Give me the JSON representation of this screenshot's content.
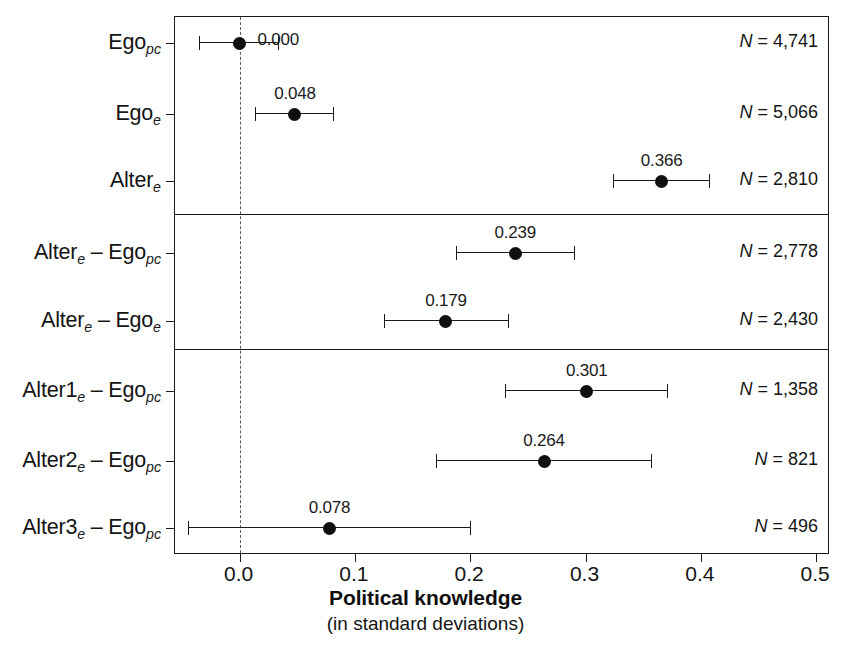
{
  "chart_data": {
    "type": "scatter",
    "subtype": "forest-plot",
    "title": "",
    "xlabel": "Political knowledge",
    "xlabel_sub": "(in standard deviations)",
    "ylabel": "",
    "xlim": [
      -0.056,
      0.512
    ],
    "xticks": [
      0.0,
      0.1,
      0.2,
      0.3,
      0.4,
      0.5
    ],
    "xticklabels": [
      "0.0",
      "0.1",
      "0.2",
      "0.3",
      "0.4",
      "0.5"
    ],
    "grid": false,
    "legend": null,
    "reference_line": 0.0,
    "reference_line_style": "dotted",
    "panels": [
      {
        "rows": [
          0,
          1,
          2
        ]
      },
      {
        "rows": [
          3,
          4
        ]
      },
      {
        "rows": [
          5,
          6,
          7
        ]
      }
    ],
    "categories": [
      "Ego_pc",
      "Ego_e",
      "Alter_e",
      "Alter_e – Ego_pc",
      "Alter_e – Ego_e",
      "Alter1_e – Ego_pc",
      "Alter2_e – Ego_pc",
      "Alter3_e – Ego_pc"
    ],
    "values": [
      0.0,
      0.048,
      0.366,
      0.239,
      0.179,
      0.301,
      0.264,
      0.078
    ],
    "ci_low": [
      -0.035,
      0.013,
      0.324,
      0.188,
      0.125,
      0.23,
      0.17,
      -0.045
    ],
    "ci_high": [
      0.033,
      0.081,
      0.407,
      0.29,
      0.233,
      0.371,
      0.357,
      0.2
    ],
    "n_values": [
      4741,
      5066,
      2810,
      2778,
      2430,
      1358,
      821,
      496
    ]
  },
  "axis": {
    "title": "Political knowledge",
    "subtitle": "(in standard deviations)",
    "ticklabels": [
      "0.0",
      "0.1",
      "0.2",
      "0.3",
      "0.4",
      "0.5"
    ]
  },
  "rows": [
    {
      "id": "ego-pc",
      "label_main": "Ego",
      "label_sub": "pc",
      "label_prefix": "",
      "estimate_text": "0.000",
      "n_text": "= 4,741",
      "n_prefix": "N "
    },
    {
      "id": "ego-e",
      "label_main": "Ego",
      "label_sub": "e",
      "label_prefix": "",
      "estimate_text": "0.048",
      "n_text": "= 5,066",
      "n_prefix": "N "
    },
    {
      "id": "alter-e",
      "label_main": "Alter",
      "label_sub": "e",
      "label_prefix": "",
      "estimate_text": "0.366",
      "n_text": "= 2,810",
      "n_prefix": "N "
    },
    {
      "id": "alter-e-minus-ego-pc",
      "label_main": "Alter",
      "label_sub": "e",
      "label_main2": " – Ego",
      "label_sub2": "pc",
      "estimate_text": "0.239",
      "n_text": "= 2,778",
      "n_prefix": "N "
    },
    {
      "id": "alter-e-minus-ego-e",
      "label_main": "Alter",
      "label_sub": "e",
      "label_main2": " – Ego",
      "label_sub2": "e",
      "estimate_text": "0.179",
      "n_text": "= 2,430",
      "n_prefix": "N "
    },
    {
      "id": "alter1-e-minus-ego-pc",
      "label_main": "Alter1",
      "label_sub": "e",
      "label_main2": " – Ego",
      "label_sub2": "pc",
      "estimate_text": "0.301",
      "n_text": "= 1,358",
      "n_prefix": "N "
    },
    {
      "id": "alter2-e-minus-ego-pc",
      "label_main": "Alter2",
      "label_sub": "e",
      "label_main2": " – Ego",
      "label_sub2": "pc",
      "estimate_text": "0.264",
      "n_text": "= 821",
      "n_prefix": "N "
    },
    {
      "id": "alter3-e-minus-ego-pc",
      "label_main": "Alter3",
      "label_sub": "e",
      "label_main2": " – Ego",
      "label_sub2": "pc",
      "estimate_text": "0.078",
      "n_text": "= 496",
      "n_prefix": "N "
    }
  ],
  "colors": {
    "point": "#101010",
    "line": "#1a1a1a",
    "reference": "#5a5a5a",
    "text": "#141414",
    "background": "#ffffff"
  }
}
